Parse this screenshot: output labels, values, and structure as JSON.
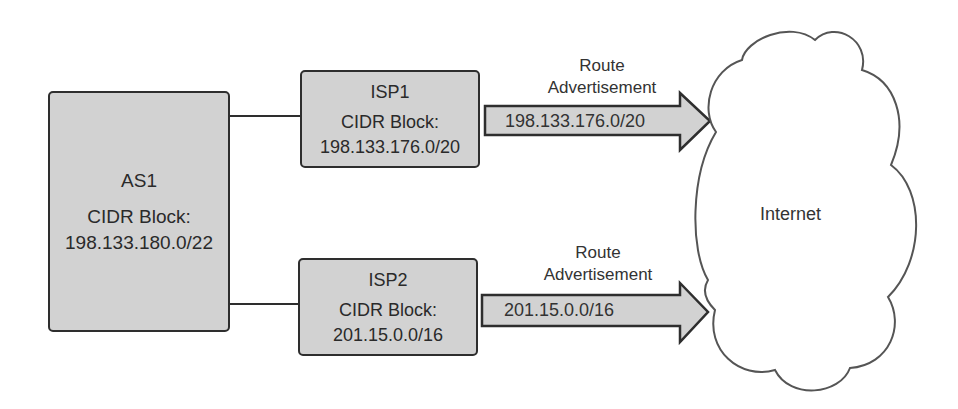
{
  "as1": {
    "name": "AS1",
    "cidr_label": "CIDR Block:",
    "cidr": "198.133.180.0/22"
  },
  "isp1": {
    "name": "ISP1",
    "cidr_label": "CIDR Block:",
    "cidr": "198.133.176.0/20",
    "route_label_1": "Route",
    "route_label_2": "Advertisement",
    "advertised": "198.133.176.0/20"
  },
  "isp2": {
    "name": "ISP2",
    "cidr_label": "CIDR Block:",
    "cidr": "201.15.0.0/16",
    "route_label_1": "Route",
    "route_label_2": "Advertisement",
    "advertised": "201.15.0.0/16"
  },
  "internet": {
    "label": "Internet"
  },
  "colors": {
    "box_fill": "#d2d2d2",
    "stroke": "#2e2e2e",
    "background": "#ffffff"
  }
}
